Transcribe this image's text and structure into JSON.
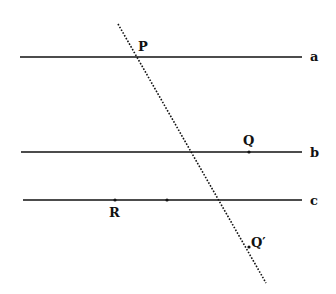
{
  "diagram": {
    "lines": [
      {
        "name": "a",
        "label": "a",
        "y": 57,
        "x1": 20,
        "x2": 302
      },
      {
        "name": "b",
        "label": "b",
        "y": 152,
        "x1": 21,
        "x2": 302
      },
      {
        "name": "c",
        "label": "c",
        "y": 200,
        "x1": 23,
        "x2": 302
      }
    ],
    "transversal": {
      "x1": 118,
      "y1": 24,
      "x2": 266,
      "y2": 283,
      "style": "dotted"
    },
    "points": [
      {
        "name": "P",
        "label": "P"
      },
      {
        "name": "Q",
        "label": "Q"
      },
      {
        "name": "R",
        "label": "R"
      },
      {
        "name": "Q-prime",
        "label": "Q′"
      }
    ],
    "colors": {
      "line": "#111111",
      "background": "#ffffff"
    }
  }
}
